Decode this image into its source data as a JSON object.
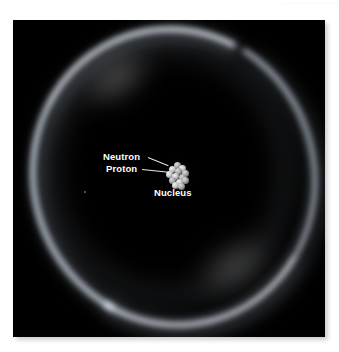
{
  "scene": {
    "title": "Atom illustration with glowing electron shell and central nucleus",
    "background_color": "#ffffff",
    "plate_color": "#000000"
  },
  "watermark": {
    "text": "•••••••••••  ••••••••••••"
  },
  "photo": {
    "shell": {
      "name": "electron-cloud-shell",
      "glow_color": "#ecf2fa",
      "halo_color": "#bec8d7"
    },
    "nucleus": {
      "name": "nucleus-cluster",
      "proton_color": "#c8c8c8",
      "neutron_color": "#a8a8a8",
      "nucleon_count": 13
    },
    "callouts": [
      {
        "id": "neutron",
        "label": "Neutron"
      },
      {
        "id": "proton",
        "label": "Proton"
      },
      {
        "id": "nucleus",
        "label": "Nucleus"
      }
    ],
    "label_color": "#ffffff",
    "leader_color": "#e8e8e8"
  }
}
